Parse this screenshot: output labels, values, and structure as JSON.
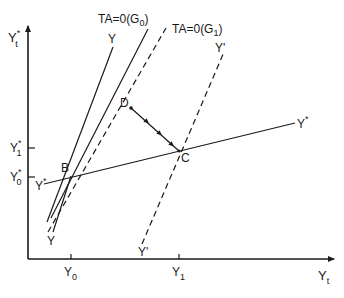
{
  "diagram": {
    "axes": {
      "y_label": "Y",
      "y_label_sup": "*",
      "y_label_sub": "t",
      "x_label": "Y",
      "x_label_sub": "t"
    },
    "x_ticks": [
      {
        "label": "Y",
        "sub": "0"
      },
      {
        "label": "Y",
        "sub": "1"
      }
    ],
    "y_ticks": [
      {
        "label": "Y",
        "sup": "*",
        "sub": "1"
      },
      {
        "label": "Y",
        "sup": "*",
        "sub": "0"
      }
    ],
    "curves": {
      "y_line": {
        "top_label": "Y",
        "bottom_label": "Y",
        "style": "solid"
      },
      "ta_g0": {
        "label": "TA=0(G",
        "sub": "0",
        "close": ")",
        "style": "solid"
      },
      "ta_g1": {
        "label": "TA=0(G",
        "sub": "1",
        "close": ")",
        "style": "dashed"
      },
      "y_prime": {
        "top_label": "Y'",
        "bottom_label": "Y'",
        "style": "dashed"
      },
      "y_star": {
        "left_label": "Y",
        "left_sup": "*",
        "right_label": "Y",
        "right_sup": "*",
        "style": "solid"
      }
    },
    "points": {
      "B": "B",
      "C": "C",
      "D": "D"
    },
    "path_note": "Arrowed adjustment path from C to D"
  }
}
